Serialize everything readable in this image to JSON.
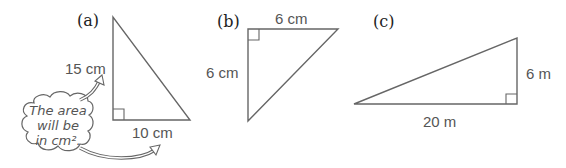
{
  "diagrams": [
    {
      "label": "(a)",
      "sides": {
        "height": "15 cm",
        "base": "10 cm"
      },
      "note": {
        "lines": [
          "The area",
          "will be",
          "in cm²."
        ]
      }
    },
    {
      "label": "(b)",
      "sides": {
        "top": "6 cm",
        "height": "6 cm"
      }
    },
    {
      "label": "(c)",
      "sides": {
        "base": "20 m",
        "height": "6 m"
      }
    }
  ],
  "colors": {
    "line": "#666666",
    "text": "#555555",
    "label": "#222222"
  }
}
